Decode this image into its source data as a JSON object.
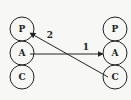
{
  "diagram": {
    "left_column": [
      {
        "id": "L-P",
        "label": "P",
        "cx": 22,
        "cy": 29
      },
      {
        "id": "L-A",
        "label": "A",
        "cx": 22,
        "cy": 53
      },
      {
        "id": "L-C",
        "label": "C",
        "cx": 22,
        "cy": 77
      }
    ],
    "right_column": [
      {
        "id": "R-P",
        "label": "P",
        "cx": 115,
        "cy": 29
      },
      {
        "id": "R-A",
        "label": "A",
        "cx": 115,
        "cy": 53
      },
      {
        "id": "R-C",
        "label": "C",
        "cx": 115,
        "cy": 77
      }
    ],
    "edges": [
      {
        "from": "L-A",
        "to": "R-A",
        "label": "1"
      },
      {
        "from": "R-C",
        "to": "L-P",
        "label": "2"
      }
    ],
    "colors": {
      "stroke": "#222222",
      "background": "#f7f7f5"
    }
  }
}
